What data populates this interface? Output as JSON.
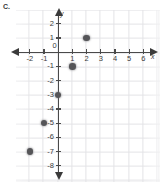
{
  "label": "C.",
  "colors": {
    "axis": "#4a4a4a",
    "grid": "#e3e3e6",
    "point": "#555558",
    "text": "#3a3a3a",
    "background": "#ffffff"
  },
  "axes": {
    "x_name": "x",
    "y_name": "y",
    "x_ticks": [
      -2,
      -1,
      0,
      1,
      2,
      3,
      4,
      5,
      6
    ],
    "y_ticks": [
      2,
      1,
      -1,
      -2,
      -3,
      -4,
      -5,
      -6,
      -7,
      -8
    ],
    "x_tick_labels": [
      "-2",
      "-1",
      "0",
      "1",
      "2",
      "3",
      "4",
      "5",
      "6"
    ],
    "y_tick_labels": [
      "2",
      "1",
      "-1",
      "-2",
      "-3",
      "-4",
      "-5",
      "-6",
      "-7",
      "-8"
    ],
    "origin_label": "0",
    "xlim": [
      -3,
      7
    ],
    "ylim": [
      -9,
      3
    ],
    "grid": true,
    "arrows": [
      "left",
      "right",
      "up",
      "down"
    ]
  },
  "chart_data": {
    "type": "scatter",
    "title": "C.",
    "xlabel": "x",
    "ylabel": "y",
    "xlim": [
      -3,
      7
    ],
    "ylim": [
      -9,
      3
    ],
    "grid": true,
    "legend": null,
    "xticks": [
      -2,
      -1,
      0,
      1,
      2,
      3,
      4,
      5,
      6
    ],
    "yticks": [
      2,
      1,
      -1,
      -2,
      -3,
      -4,
      -5,
      -6,
      -7,
      -8
    ],
    "series": [
      {
        "name": "plotted points",
        "marker": "filled-circle",
        "color": "#555558",
        "points": [
          {
            "x": -2,
            "y": -7
          },
          {
            "x": -1,
            "y": -5
          },
          {
            "x": 0,
            "y": -3
          },
          {
            "x": 1,
            "y": -1
          },
          {
            "x": 2,
            "y": 1
          }
        ]
      }
    ]
  }
}
